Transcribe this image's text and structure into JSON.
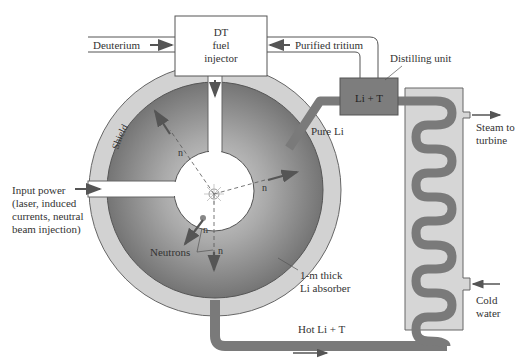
{
  "colors": {
    "outline": "#555555",
    "shield": "#d2d2d2",
    "absorber_dark": "#6f6f6f",
    "absorber_light": "#c8c8c8",
    "pipe": "#7a7a7a",
    "distiller": "#7d7d7d",
    "exchanger": "#d6d6d6",
    "arrow": "#555555",
    "text": "#333333"
  },
  "labels": {
    "injector": [
      "DT",
      "fuel",
      "injector"
    ],
    "deuterium": "Deuterium",
    "purified_tritium": "Purified tritium",
    "distilling_unit": "Distilling unit",
    "li_t": "Li + T",
    "pure_li": "Pure Li",
    "shield": "Shield",
    "steam": [
      "Steam to",
      "turbine"
    ],
    "input_power": [
      "Input power",
      "(laser, induced",
      "currents, neutral",
      "beam injection)"
    ],
    "neutrons": "Neutrons",
    "neutron_symbol": "n",
    "absorber": [
      "1-m thick",
      "Li absorber"
    ],
    "hot_li_t": "Hot Li + T",
    "cold_water": [
      "Cold",
      "water"
    ]
  }
}
